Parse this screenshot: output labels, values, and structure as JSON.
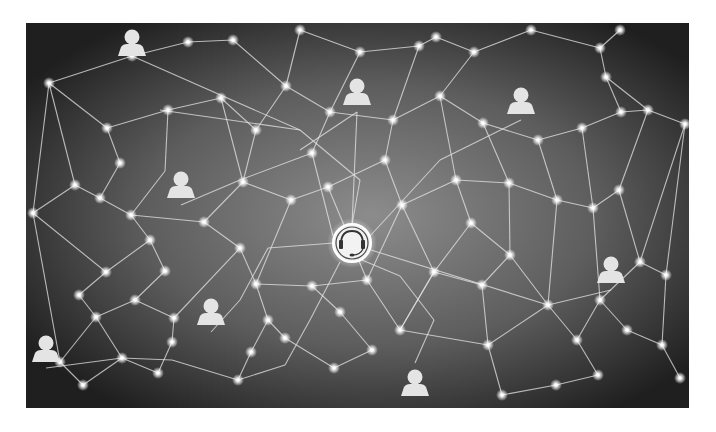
{
  "image": {
    "description": "Grayscale network illustration: user icons connected through a mesh of glowing nodes to a central customer-support headset hub",
    "frame": {
      "x": 26,
      "y": 23,
      "width": 663,
      "height": 385
    },
    "colors": {
      "background_center": "#8a8a8a",
      "background_edge": "#1e1e1e",
      "line": "#e6e6e6",
      "node": "#ffffff",
      "icon": "#e4e4e4"
    }
  },
  "hub": {
    "icon": "headset-icon",
    "x": 352,
    "y": 243,
    "r": 19
  },
  "people": [
    {
      "icon": "person-icon",
      "x": 132,
      "y": 43
    },
    {
      "icon": "person-icon",
      "x": 357,
      "y": 92
    },
    {
      "icon": "person-icon",
      "x": 521,
      "y": 101
    },
    {
      "icon": "person-icon",
      "x": 181,
      "y": 185
    },
    {
      "icon": "person-icon",
      "x": 611,
      "y": 270
    },
    {
      "icon": "person-icon",
      "x": 211,
      "y": 312
    },
    {
      "icon": "person-icon",
      "x": 46,
      "y": 349
    },
    {
      "icon": "person-icon",
      "x": 415,
      "y": 383
    }
  ],
  "nodes": [
    [
      49,
      83
    ],
    [
      132,
      56
    ],
    [
      188,
      42
    ],
    [
      233,
      40
    ],
    [
      300,
      30
    ],
    [
      360,
      52
    ],
    [
      419,
      46
    ],
    [
      436,
      37
    ],
    [
      474,
      52
    ],
    [
      531,
      30
    ],
    [
      600,
      48
    ],
    [
      620,
      30
    ],
    [
      107,
      128
    ],
    [
      168,
      110
    ],
    [
      221,
      98
    ],
    [
      256,
      130
    ],
    [
      286,
      86
    ],
    [
      330,
      112
    ],
    [
      393,
      120
    ],
    [
      440,
      96
    ],
    [
      483,
      123
    ],
    [
      538,
      140
    ],
    [
      582,
      128
    ],
    [
      606,
      77
    ],
    [
      621,
      112
    ],
    [
      648,
      110
    ],
    [
      685,
      124
    ],
    [
      33,
      213
    ],
    [
      75,
      185
    ],
    [
      100,
      198
    ],
    [
      120,
      163
    ],
    [
      131,
      215
    ],
    [
      150,
      240
    ],
    [
      165,
      271
    ],
    [
      204,
      222
    ],
    [
      243,
      182
    ],
    [
      291,
      200
    ],
    [
      312,
      153
    ],
    [
      328,
      187
    ],
    [
      385,
      160
    ],
    [
      402,
      205
    ],
    [
      456,
      180
    ],
    [
      509,
      183
    ],
    [
      557,
      200
    ],
    [
      593,
      208
    ],
    [
      619,
      190
    ],
    [
      640,
      262
    ],
    [
      666,
      275
    ],
    [
      106,
      272
    ],
    [
      79,
      295
    ],
    [
      96,
      317
    ],
    [
      135,
      300
    ],
    [
      174,
      318
    ],
    [
      240,
      248
    ],
    [
      256,
      284
    ],
    [
      268,
      320
    ],
    [
      312,
      286
    ],
    [
      367,
      280
    ],
    [
      400,
      330
    ],
    [
      434,
      272
    ],
    [
      471,
      223
    ],
    [
      482,
      285
    ],
    [
      510,
      255
    ],
    [
      548,
      305
    ],
    [
      577,
      340
    ],
    [
      600,
      300
    ],
    [
      627,
      330
    ],
    [
      662,
      345
    ],
    [
      60,
      362
    ],
    [
      83,
      385
    ],
    [
      122,
      358
    ],
    [
      158,
      373
    ],
    [
      172,
      342
    ],
    [
      238,
      380
    ],
    [
      251,
      352
    ],
    [
      285,
      338
    ],
    [
      340,
      312
    ],
    [
      372,
      350
    ],
    [
      334,
      368
    ],
    [
      488,
      345
    ],
    [
      502,
      395
    ],
    [
      556,
      385
    ],
    [
      598,
      375
    ],
    [
      680,
      378
    ]
  ],
  "edges": [
    [
      132,
      56,
      300,
      130
    ],
    [
      300,
      130,
      360,
      180
    ],
    [
      360,
      180,
      352,
      225
    ],
    [
      160,
      110,
      300,
      130
    ],
    [
      357,
      112,
      300,
      150
    ],
    [
      357,
      112,
      352,
      225
    ],
    [
      521,
      120,
      440,
      160
    ],
    [
      440,
      160,
      370,
      236
    ],
    [
      181,
      205,
      240,
      180
    ],
    [
      240,
      180,
      312,
      153
    ],
    [
      312,
      153,
      333,
      236
    ],
    [
      611,
      290,
      548,
      305
    ],
    [
      548,
      305,
      371,
      250
    ],
    [
      211,
      332,
      240,
      300
    ],
    [
      240,
      300,
      268,
      248
    ],
    [
      268,
      248,
      334,
      243
    ],
    [
      46,
      368,
      122,
      358
    ],
    [
      122,
      358,
      172,
      360
    ],
    [
      172,
      360,
      238,
      380
    ],
    [
      238,
      380,
      285,
      365
    ],
    [
      285,
      365,
      310,
      320
    ],
    [
      310,
      320,
      340,
      262
    ],
    [
      415,
      363,
      434,
      320
    ],
    [
      434,
      320,
      400,
      276
    ],
    [
      400,
      276,
      362,
      260
    ],
    [
      49,
      83,
      132,
      56
    ],
    [
      49,
      83,
      107,
      128
    ],
    [
      107,
      128,
      168,
      110
    ],
    [
      168,
      110,
      221,
      98
    ],
    [
      221,
      98,
      256,
      130
    ],
    [
      256,
      130,
      286,
      86
    ],
    [
      286,
      86,
      233,
      40
    ],
    [
      233,
      40,
      188,
      42
    ],
    [
      188,
      42,
      132,
      56
    ],
    [
      286,
      86,
      330,
      112
    ],
    [
      330,
      112,
      393,
      120
    ],
    [
      393,
      120,
      440,
      96
    ],
    [
      440,
      96,
      474,
      52
    ],
    [
      474,
      52,
      531,
      30
    ],
    [
      531,
      30,
      600,
      48
    ],
    [
      600,
      48,
      620,
      30
    ],
    [
      600,
      48,
      606,
      77
    ],
    [
      606,
      77,
      648,
      110
    ],
    [
      648,
      110,
      685,
      124
    ],
    [
      606,
      77,
      621,
      112
    ],
    [
      621,
      112,
      648,
      110
    ],
    [
      621,
      112,
      582,
      128
    ],
    [
      582,
      128,
      538,
      140
    ],
    [
      538,
      140,
      483,
      123
    ],
    [
      483,
      123,
      440,
      96
    ],
    [
      483,
      123,
      509,
      183
    ],
    [
      538,
      140,
      557,
      200
    ],
    [
      582,
      128,
      593,
      208
    ],
    [
      648,
      110,
      619,
      190
    ],
    [
      685,
      124,
      666,
      275
    ],
    [
      685,
      124,
      640,
      262
    ],
    [
      33,
      213,
      75,
      185
    ],
    [
      75,
      185,
      100,
      198
    ],
    [
      100,
      198,
      120,
      163
    ],
    [
      120,
      163,
      107,
      128
    ],
    [
      75,
      185,
      49,
      83
    ],
    [
      33,
      213,
      49,
      83
    ],
    [
      100,
      198,
      131,
      215
    ],
    [
      131,
      215,
      150,
      240
    ],
    [
      150,
      240,
      165,
      271
    ],
    [
      131,
      215,
      204,
      222
    ],
    [
      204,
      222,
      243,
      182
    ],
    [
      243,
      182,
      256,
      130
    ],
    [
      204,
      222,
      240,
      248
    ],
    [
      150,
      240,
      106,
      272
    ],
    [
      106,
      272,
      79,
      295
    ],
    [
      79,
      295,
      96,
      317
    ],
    [
      96,
      317,
      135,
      300
    ],
    [
      135,
      300,
      174,
      318
    ],
    [
      165,
      271,
      135,
      300
    ],
    [
      33,
      213,
      60,
      362
    ],
    [
      33,
      213,
      106,
      272
    ],
    [
      291,
      200,
      328,
      187
    ],
    [
      328,
      187,
      385,
      160
    ],
    [
      385,
      160,
      402,
      205
    ],
    [
      402,
      205,
      456,
      180
    ],
    [
      456,
      180,
      509,
      183
    ],
    [
      509,
      183,
      557,
      200
    ],
    [
      557,
      200,
      593,
      208
    ],
    [
      593,
      208,
      619,
      190
    ],
    [
      619,
      190,
      640,
      262
    ],
    [
      640,
      262,
      666,
      275
    ],
    [
      666,
      275,
      662,
      345
    ],
    [
      662,
      345,
      680,
      378
    ],
    [
      627,
      330,
      662,
      345
    ],
    [
      600,
      300,
      627,
      330
    ],
    [
      577,
      340,
      600,
      300
    ],
    [
      577,
      340,
      598,
      375
    ],
    [
      598,
      375,
      556,
      385
    ],
    [
      556,
      385,
      502,
      395
    ],
    [
      502,
      395,
      488,
      345
    ],
    [
      488,
      345,
      482,
      285
    ],
    [
      482,
      285,
      510,
      255
    ],
    [
      510,
      255,
      471,
      223
    ],
    [
      471,
      223,
      434,
      272
    ],
    [
      434,
      272,
      400,
      330
    ],
    [
      400,
      330,
      367,
      280
    ],
    [
      367,
      280,
      312,
      286
    ],
    [
      312,
      286,
      256,
      284
    ],
    [
      256,
      284,
      240,
      248
    ],
    [
      256,
      284,
      268,
      320
    ],
    [
      268,
      320,
      251,
      352
    ],
    [
      251,
      352,
      238,
      380
    ],
    [
      312,
      286,
      340,
      312
    ],
    [
      340,
      312,
      372,
      350
    ],
    [
      372,
      350,
      334,
      368
    ],
    [
      334,
      368,
      285,
      338
    ],
    [
      285,
      338,
      268,
      320
    ],
    [
      402,
      205,
      434,
      272
    ],
    [
      456,
      180,
      471,
      223
    ],
    [
      509,
      183,
      510,
      255
    ],
    [
      557,
      200,
      548,
      305
    ],
    [
      593,
      208,
      600,
      300
    ],
    [
      640,
      262,
      600,
      300
    ],
    [
      510,
      255,
      548,
      305
    ],
    [
      482,
      285,
      434,
      272
    ],
    [
      488,
      345,
      548,
      305
    ],
    [
      577,
      340,
      548,
      305
    ],
    [
      400,
      330,
      434,
      272
    ],
    [
      400,
      330,
      488,
      345
    ],
    [
      60,
      362,
      83,
      385
    ],
    [
      60,
      362,
      96,
      317
    ],
    [
      122,
      358,
      96,
      317
    ],
    [
      158,
      373,
      122,
      358
    ],
    [
      172,
      342,
      174,
      318
    ],
    [
      172,
      342,
      158,
      373
    ],
    [
      174,
      318,
      240,
      248
    ],
    [
      83,
      385,
      122,
      358
    ],
    [
      300,
      30,
      360,
      52
    ],
    [
      360,
      52,
      419,
      46
    ],
    [
      419,
      46,
      436,
      37
    ],
    [
      360,
      52,
      330,
      112
    ],
    [
      419,
      46,
      393,
      120
    ],
    [
      436,
      37,
      474,
      52
    ],
    [
      300,
      30,
      286,
      86
    ],
    [
      168,
      110,
      165,
      171
    ],
    [
      165,
      171,
      131,
      215
    ],
    [
      221,
      98,
      243,
      182
    ],
    [
      312,
      153,
      330,
      112
    ],
    [
      385,
      160,
      393,
      120
    ],
    [
      440,
      96,
      456,
      180
    ],
    [
      402,
      205,
      367,
      280
    ],
    [
      291,
      200,
      243,
      182
    ],
    [
      291,
      200,
      256,
      284
    ],
    [
      328,
      187,
      367,
      280
    ]
  ]
}
